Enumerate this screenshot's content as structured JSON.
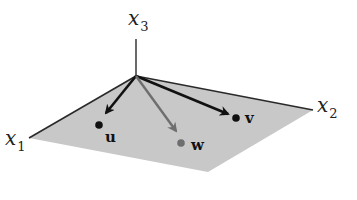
{
  "figure": {
    "axes": {
      "x1": {
        "label": "x",
        "subscript": "1"
      },
      "x2": {
        "label": "x",
        "subscript": "2"
      },
      "x3": {
        "label": "x",
        "subscript": "3"
      }
    },
    "vectors": [
      {
        "name": "u",
        "label": "u",
        "color": "#111111"
      },
      {
        "name": "v",
        "label": "v",
        "color": "#111111"
      },
      {
        "name": "w",
        "label": "w",
        "color": "#6e6e6e"
      }
    ],
    "plane_color": "#c8c8c8",
    "edge_color": "#2a2a2a"
  }
}
